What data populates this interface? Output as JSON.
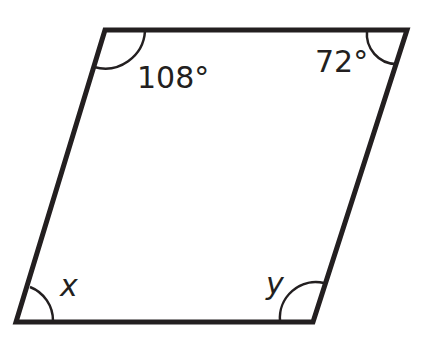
{
  "diagram": {
    "type": "parallelogram",
    "stroke_color": "#231f20",
    "vertices": {
      "top_left": [
        105,
        30
      ],
      "top_right": [
        407,
        30
      ],
      "bottom_right": [
        313,
        322
      ],
      "bottom_left": [
        16,
        322
      ]
    },
    "angles": {
      "top_left": "108°",
      "top_right": "72°",
      "bottom_left": "x",
      "bottom_right": "y"
    }
  }
}
